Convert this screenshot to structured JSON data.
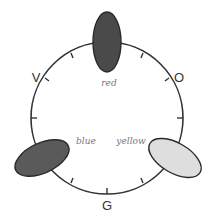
{
  "diagram": {
    "type": "color-wheel",
    "center": [
      107,
      118
    ],
    "radius": 76,
    "stroke_color": "#333333",
    "outer_labels": [
      {
        "text": "V",
        "x": 36,
        "y": 82
      },
      {
        "text": "O",
        "x": 179,
        "y": 82
      },
      {
        "text": "G",
        "x": 107,
        "y": 210
      }
    ],
    "blobs": [
      {
        "name": "red",
        "label": "red",
        "cx": 107,
        "cy": 42,
        "rx": 14,
        "ry": 30,
        "rotate": 0,
        "fill": "#4a4a4a",
        "label_x": 109,
        "label_y": 86
      },
      {
        "name": "blue",
        "label": "blue",
        "cx": 42,
        "cy": 158,
        "rx": 29,
        "ry": 15,
        "rotate": -25,
        "fill": "#5a5a5a",
        "label_x": 86,
        "label_y": 144
      },
      {
        "name": "yellow",
        "label": "yellow",
        "cx": 175,
        "cy": 158,
        "rx": 29,
        "ry": 15,
        "rotate": 30,
        "fill": "#dedede",
        "label_x": 131,
        "label_y": 144
      }
    ],
    "tick_angles_deg": [
      -120,
      -60,
      -30,
      0,
      30,
      60,
      120,
      150,
      180,
      210
    ]
  }
}
